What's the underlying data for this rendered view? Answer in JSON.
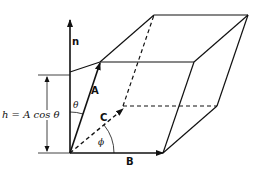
{
  "figure": {
    "type": "parallelepiped-volume-diagram",
    "vectors": {
      "n": "n",
      "A": "A",
      "B": "B",
      "C": "C"
    },
    "angles": {
      "theta": "θ",
      "phi": "ϕ"
    },
    "height_label": "h = A  cos θ",
    "colors": {
      "line": "#111111",
      "background": "#ffffff"
    }
  }
}
